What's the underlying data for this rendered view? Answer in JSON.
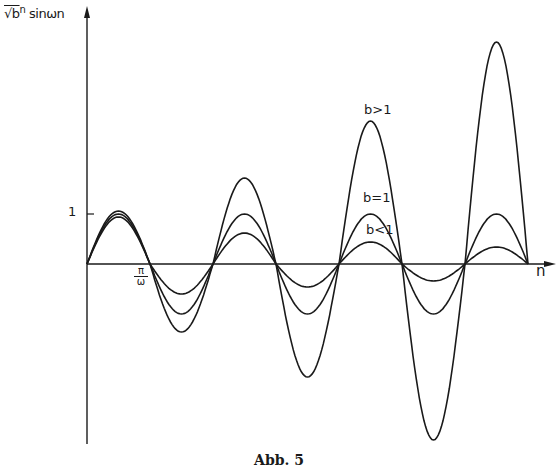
{
  "chart_data": {
    "type": "line",
    "title": "",
    "caption": "Abb. 5",
    "xlabel": "n",
    "ylabel": "√b^n sinωn",
    "ylabel_parts": {
      "radical": "√b",
      "exponent": "n",
      "rest": "sinωn"
    },
    "y_ticks": [
      {
        "value": 1,
        "label": "1"
      }
    ],
    "x_ticks": [
      {
        "value": "π/ω",
        "label_num": "π",
        "label_den": "ω"
      }
    ],
    "x_unit": "π/ω",
    "x_range_halfperiods": [
      0,
      7.5
    ],
    "ylim": [
      -3.6,
      4.6
    ],
    "grid": false,
    "legend_position": "inline labels near 5th positive lobe",
    "series": [
      {
        "name": "b>1",
        "label": "b>1",
        "extrema": [
          1.06,
          -1.36,
          1.72,
          -2.26,
          2.86,
          -3.52,
          4.44
        ]
      },
      {
        "name": "b=1",
        "label": "b=1",
        "extrema": [
          1.0,
          -1.0,
          1.0,
          -1.0,
          1.0,
          -1.0,
          1.0
        ]
      },
      {
        "name": "b<1",
        "label": "b<1",
        "extrema": [
          0.94,
          -0.6,
          0.62,
          -0.46,
          0.44,
          -0.34,
          0.34
        ]
      }
    ]
  },
  "labels": {
    "ylabel_radical": "√b",
    "ylabel_exp": "n",
    "ylabel_rest": "sinωn",
    "xlabel": "n",
    "tick_one": "1",
    "pi_num": "π",
    "pi_den": "ω",
    "legend_bgt": "b>1",
    "legend_beq": "b=1",
    "legend_blt": "b<1",
    "caption": "Abb. 5"
  },
  "colors": {
    "ink": "#1a1a1a",
    "background": "#ffffff"
  }
}
